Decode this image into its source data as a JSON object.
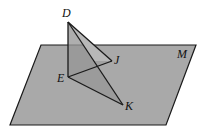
{
  "diagram": {
    "type": "3d-geometry",
    "colors": {
      "background": "#ffffff",
      "plane_fill": "#a9a9a9",
      "triangle_fill": "#8f8f8f",
      "triangle_above_fill": "#cfcfcf",
      "stroke": "#1a1a1a"
    },
    "plane": {
      "label": "M",
      "points": [
        [
          41,
          45
        ],
        [
          196,
          45
        ],
        [
          166,
          125
        ],
        [
          10,
          125
        ]
      ],
      "label_pos": [
        177,
        58
      ]
    },
    "points": {
      "D": {
        "label": "D",
        "x": 68,
        "y": 22,
        "label_x": 62,
        "label_y": 17
      },
      "E": {
        "label": "E",
        "x": 68,
        "y": 77,
        "label_x": 57,
        "label_y": 82
      },
      "J": {
        "label": "J",
        "x": 112,
        "y": 61,
        "label_x": 114,
        "label_y": 64
      },
      "K": {
        "label": "K",
        "x": 123,
        "y": 105,
        "label_x": 125,
        "label_y": 110
      }
    },
    "segments": [
      {
        "from": "D",
        "to": "E"
      },
      {
        "from": "D",
        "to": "J"
      },
      {
        "from": "D",
        "to": "K"
      },
      {
        "from": "E",
        "to": "J"
      },
      {
        "from": "E",
        "to": "K"
      }
    ]
  }
}
